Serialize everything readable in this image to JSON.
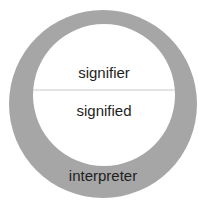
{
  "diagram": {
    "labels": {
      "signifier": "signifier",
      "signified": "signified",
      "interpreter": "interpreter"
    },
    "colors": {
      "outer_ring": "#a6a6a6",
      "inner_circle": "#ffffff",
      "divider": "#c8c8c8",
      "text": "#1e1e1e"
    }
  }
}
